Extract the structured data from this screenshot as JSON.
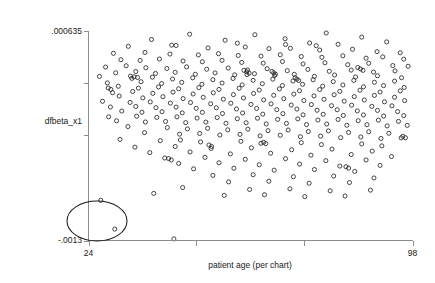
{
  "chart_data": {
    "type": "scatter",
    "title": "",
    "xlabel": "patient age (per chart)",
    "ylabel": "dfbeta_x1",
    "xlim": [
      24,
      98
    ],
    "ylim": [
      -0.0013,
      0.000635
    ],
    "grid": false,
    "legend": null,
    "x_tick_labels": [
      "24",
      "98"
    ],
    "y_tick_labels": [
      ".000635",
      "-.0013"
    ],
    "x_ticks": [
      24,
      48.6,
      73.3,
      98
    ],
    "y_ticks": [
      0.000635,
      0.000154,
      -0.000327,
      -0.0013
    ],
    "marker": "open-circle",
    "annotations": [
      {
        "kind": "ellipse",
        "label": "outlier-highlight-ellipse",
        "cx": 42.5,
        "cy": -0.00122,
        "note": "hand-drawn oval circling two low-leverage outlier points near the origin corner"
      }
    ],
    "points": [
      [
        47.1,
        0.000601
      ],
      [
        62.0,
        0.000596
      ],
      [
        78.3,
        0.000612
      ],
      [
        86.4,
        0.000574
      ],
      [
        92.1,
        0.00053
      ],
      [
        38.4,
        0.000552
      ],
      [
        55.2,
        0.000545
      ],
      [
        68.9,
        0.000559
      ],
      [
        74.5,
        0.00052
      ],
      [
        81.0,
        0.000508
      ],
      [
        33.1,
        0.000489
      ],
      [
        44.0,
        0.000497
      ],
      [
        51.3,
        0.000474
      ],
      [
        59.8,
        0.000483
      ],
      [
        65.2,
        0.000468
      ],
      [
        70.1,
        0.000471
      ],
      [
        76.8,
        0.000455
      ],
      [
        84.3,
        0.000462
      ],
      [
        89.9,
        0.00044
      ],
      [
        95.2,
        0.00043
      ],
      [
        29.7,
        0.000425
      ],
      [
        36.9,
        0.000433
      ],
      [
        42.6,
        0.000418
      ],
      [
        49.1,
        0.00041
      ],
      [
        53.7,
        0.000421
      ],
      [
        58.2,
        0.000405
      ],
      [
        63.4,
        0.000399
      ],
      [
        67.8,
        0.000412
      ],
      [
        72.6,
        0.000395
      ],
      [
        77.3,
        0.000388
      ],
      [
        82.1,
        0.000402
      ],
      [
        87.4,
        0.00038
      ],
      [
        91.2,
        0.000392
      ],
      [
        96.0,
        0.000371
      ],
      [
        31.4,
        0.000366
      ],
      [
        35.8,
        0.000359
      ],
      [
        40.2,
        0.000372
      ],
      [
        45.6,
        0.000354
      ],
      [
        50.0,
        0.000347
      ],
      [
        54.5,
        0.00036
      ],
      [
        59.0,
        0.000341
      ],
      [
        63.9,
        0.000334
      ],
      [
        68.3,
        0.000349
      ],
      [
        73.0,
        0.000327
      ],
      [
        78.0,
        0.000338
      ],
      [
        83.2,
        0.00032
      ],
      [
        88.0,
        0.000333
      ],
      [
        93.5,
        0.000312
      ],
      [
        97.0,
        0.000305
      ],
      [
        27.9,
        0.000298
      ],
      [
        32.6,
        0.00031
      ],
      [
        37.1,
        0.000292
      ],
      [
        41.9,
        0.000285
      ],
      [
        46.4,
        0.0003
      ],
      [
        51.0,
        0.000278
      ],
      [
        55.9,
        0.000289
      ],
      [
        60.3,
        0.000271
      ],
      [
        64.8,
        0.000283
      ],
      [
        69.4,
        0.000265
      ],
      [
        74.1,
        0.000276
      ],
      [
        79.0,
        0.000259
      ],
      [
        84.0,
        0.00027
      ],
      [
        89.1,
        0.000252
      ],
      [
        94.0,
        0.000263
      ],
      [
        30.2,
        0.000245
      ],
      [
        34.8,
        0.000257
      ],
      [
        39.3,
        0.000239
      ],
      [
        43.8,
        0.00025
      ],
      [
        48.4,
        0.000232
      ],
      [
        52.9,
        0.000244
      ],
      [
        57.4,
        0.000226
      ],
      [
        61.9,
        0.000237
      ],
      [
        66.5,
        0.00022
      ],
      [
        71.0,
        0.000231
      ],
      [
        75.6,
        0.000213
      ],
      [
        80.2,
        0.000225
      ],
      [
        85.0,
        0.000207
      ],
      [
        90.0,
        0.000218
      ],
      [
        95.5,
        0.0002
      ],
      [
        26.5,
        0.000212
      ],
      [
        33.9,
        0.000194
      ],
      [
        38.6,
        0.000205
      ],
      [
        43.2,
        0.000188
      ],
      [
        47.8,
        0.000199
      ],
      [
        52.4,
        0.000182
      ],
      [
        57.0,
        0.000193
      ],
      [
        61.6,
        0.000176
      ],
      [
        66.1,
        0.000187
      ],
      [
        70.7,
        0.00017
      ],
      [
        75.3,
        0.000181
      ],
      [
        79.9,
        0.000164
      ],
      [
        84.6,
        0.000175
      ],
      [
        89.3,
        0.000158
      ],
      [
        93.9,
        0.000169
      ],
      [
        28.3,
        0.000152
      ],
      [
        36.0,
        0.000163
      ],
      [
        40.7,
        0.000146
      ],
      [
        45.3,
        0.000157
      ],
      [
        49.9,
        0.00014
      ],
      [
        54.5,
        0.000151
      ],
      [
        59.1,
        0.000134
      ],
      [
        63.7,
        0.000145
      ],
      [
        68.3,
        0.000128
      ],
      [
        72.9,
        0.000139
      ],
      [
        77.5,
        0.000122
      ],
      [
        82.1,
        0.000133
      ],
      [
        86.8,
        0.000116
      ],
      [
        91.4,
        0.000127
      ],
      [
        96.1,
        0.00011
      ],
      [
        30.8,
        0.000121
      ],
      [
        35.4,
        0.000104
      ],
      [
        40.0,
        0.000115
      ],
      [
        44.6,
        9.8e-05
      ],
      [
        49.2,
        0.000109
      ],
      [
        53.8,
        9.2e-05
      ],
      [
        58.4,
        0.000103
      ],
      [
        63.0,
        8.6e-05
      ],
      [
        67.6,
        9.7e-05
      ],
      [
        72.2,
        8e-05
      ],
      [
        76.8,
        9.1e-05
      ],
      [
        81.4,
        7.4e-05
      ],
      [
        86.0,
        8.5e-05
      ],
      [
        90.6,
        6.8e-05
      ],
      [
        95.2,
        7.9e-05
      ],
      [
        29.5,
        6.2e-05
      ],
      [
        34.1,
        7.3e-05
      ],
      [
        38.7,
        5.6e-05
      ],
      [
        43.3,
        6.7e-05
      ],
      [
        47.9,
        5e-05
      ],
      [
        52.5,
        6.1e-05
      ],
      [
        57.1,
        4.4e-05
      ],
      [
        61.7,
        5.5e-05
      ],
      [
        66.3,
        3.8e-05
      ],
      [
        70.9,
        4.9e-05
      ],
      [
        75.5,
        3.2e-05
      ],
      [
        80.1,
        4.3e-05
      ],
      [
        84.7,
        2.6e-05
      ],
      [
        89.3,
        3.7e-05
      ],
      [
        93.9,
        2e-05
      ],
      [
        31.0,
        3.1e-05
      ],
      [
        36.4,
        1.4e-05
      ],
      [
        41.0,
        2.5e-05
      ],
      [
        45.6,
        8e-06
      ],
      [
        50.2,
        1.9e-05
      ],
      [
        54.8,
        2e-06
      ],
      [
        59.4,
        1.3e-05
      ],
      [
        64.0,
        -4e-06
      ],
      [
        68.6,
        7e-06
      ],
      [
        73.2,
        -1e-05
      ],
      [
        77.8,
        1e-06
      ],
      [
        82.4,
        -1.6e-05
      ],
      [
        87.0,
        -5e-06
      ],
      [
        91.6,
        -2.2e-05
      ],
      [
        96.2,
        -1.1e-05
      ],
      [
        27.2,
        -1.7e-05
      ],
      [
        33.5,
        -2.8e-05
      ],
      [
        38.1,
        -2.3e-05
      ],
      [
        42.7,
        -3.4e-05
      ],
      [
        47.3,
        -2.9e-05
      ],
      [
        51.9,
        -4e-05
      ],
      [
        56.5,
        -3.5e-05
      ],
      [
        61.1,
        -4.6e-05
      ],
      [
        65.7,
        -4.1e-05
      ],
      [
        70.3,
        -5.2e-05
      ],
      [
        74.9,
        -4.7e-05
      ],
      [
        79.5,
        -5.8e-05
      ],
      [
        84.1,
        -5.3e-05
      ],
      [
        88.7,
        -6.4e-05
      ],
      [
        93.3,
        -5.9e-05
      ],
      [
        29.0,
        -7e-05
      ],
      [
        34.8,
        -6.5e-05
      ],
      [
        39.4,
        -7.6e-05
      ],
      [
        44.0,
        -7.1e-05
      ],
      [
        48.6,
        -8.2e-05
      ],
      [
        53.2,
        -7.7e-05
      ],
      [
        57.8,
        -8.8e-05
      ],
      [
        62.4,
        -8.3e-05
      ],
      [
        67.0,
        -9.4e-05
      ],
      [
        71.6,
        -8.9e-05
      ],
      [
        76.2,
        -0.0001
      ],
      [
        80.8,
        -9.5e-05
      ],
      [
        85.4,
        -0.000106
      ],
      [
        90.0,
        -0.000101
      ],
      [
        94.6,
        -0.000112
      ],
      [
        31.6,
        -0.000107
      ],
      [
        36.2,
        -0.000118
      ],
      [
        40.8,
        -0.000113
      ],
      [
        45.4,
        -0.000124
      ],
      [
        50.0,
        -0.000119
      ],
      [
        54.6,
        -0.00013
      ],
      [
        59.2,
        -0.000125
      ],
      [
        63.8,
        -0.000136
      ],
      [
        68.4,
        -0.000131
      ],
      [
        73.0,
        -0.000142
      ],
      [
        77.6,
        -0.000137
      ],
      [
        82.2,
        -0.000148
      ],
      [
        86.8,
        -0.000143
      ],
      [
        91.4,
        -0.000154
      ],
      [
        96.0,
        -0.000149
      ],
      [
        28.6,
        -0.00016
      ],
      [
        35.0,
        -0.000155
      ],
      [
        39.6,
        -0.000166
      ],
      [
        44.2,
        -0.000161
      ],
      [
        48.8,
        -0.000172
      ],
      [
        53.4,
        -0.000167
      ],
      [
        58.0,
        -0.000178
      ],
      [
        62.6,
        -0.000173
      ],
      [
        67.2,
        -0.000184
      ],
      [
        71.8,
        -0.000179
      ],
      [
        76.4,
        -0.00019
      ],
      [
        81.0,
        -0.000185
      ],
      [
        85.6,
        -0.000196
      ],
      [
        90.2,
        -0.000191
      ],
      [
        94.8,
        -0.000202
      ],
      [
        30.4,
        -0.000197
      ],
      [
        37.0,
        -0.000208
      ],
      [
        41.6,
        -0.000203
      ],
      [
        46.2,
        -0.000214
      ],
      [
        50.8,
        -0.000209
      ],
      [
        55.4,
        -0.00022
      ],
      [
        60.0,
        -0.000215
      ],
      [
        64.6,
        -0.000226
      ],
      [
        69.2,
        -0.000221
      ],
      [
        73.8,
        -0.000232
      ],
      [
        78.4,
        -0.000227
      ],
      [
        83.0,
        -0.000238
      ],
      [
        87.6,
        -0.000233
      ],
      [
        92.2,
        -0.000244
      ],
      [
        96.8,
        -0.000239
      ],
      [
        33.0,
        -0.00025
      ],
      [
        42.0,
        -0.00026
      ],
      [
        46.6,
        -0.000272
      ],
      [
        51.2,
        -0.000266
      ],
      [
        55.8,
        -0.00028
      ],
      [
        60.4,
        -0.000274
      ],
      [
        65.0,
        -0.000288
      ],
      [
        69.6,
        -0.000282
      ],
      [
        74.2,
        -0.000296
      ],
      [
        78.8,
        -0.00029
      ],
      [
        83.4,
        -0.000304
      ],
      [
        88.0,
        -0.000298
      ],
      [
        92.6,
        -0.000312
      ],
      [
        36.8,
        -0.000306
      ],
      [
        44.8,
        -0.00032
      ],
      [
        49.4,
        -0.000314
      ],
      [
        54.0,
        -0.000328
      ],
      [
        58.6,
        -0.000322
      ],
      [
        63.2,
        -0.000336
      ],
      [
        67.8,
        -0.00033
      ],
      [
        72.4,
        -0.000344
      ],
      [
        77.0,
        -0.000338
      ],
      [
        81.6,
        -0.000352
      ],
      [
        86.2,
        -0.000346
      ],
      [
        90.8,
        -0.00036
      ],
      [
        95.4,
        -0.000354
      ],
      [
        31.2,
        -0.000368
      ],
      [
        40.4,
        -0.00038
      ],
      [
        45.0,
        -0.000374
      ],
      [
        49.6,
        -0.000392
      ],
      [
        58.8,
        -0.000386
      ],
      [
        63.4,
        -0.000404
      ],
      [
        72.6,
        -0.000398
      ],
      [
        77.2,
        -0.000416
      ],
      [
        86.4,
        -0.00041
      ],
      [
        91.0,
        -0.000428
      ],
      [
        34.6,
        -0.00044
      ],
      [
        43.8,
        -0.000434
      ],
      [
        52.0,
        -0.000452
      ],
      [
        61.2,
        -0.000446
      ],
      [
        70.4,
        -0.000464
      ],
      [
        79.6,
        -0.000458
      ],
      [
        88.8,
        -0.000476
      ],
      [
        38.0,
        -0.00049
      ],
      [
        47.2,
        -0.000484
      ],
      [
        56.4,
        -0.000502
      ],
      [
        65.6,
        -0.000496
      ],
      [
        74.8,
        -0.000514
      ],
      [
        84.0,
        -0.000508
      ],
      [
        93.2,
        -0.000526
      ],
      [
        41.4,
        -0.00054
      ],
      [
        50.6,
        -0.000534
      ],
      [
        59.8,
        -0.000552
      ],
      [
        69.0,
        -0.000546
      ],
      [
        78.2,
        -0.000564
      ],
      [
        87.4,
        -0.000558
      ],
      [
        44.6,
        -0.00059
      ],
      [
        53.8,
        -0.000584
      ],
      [
        63.0,
        -0.000602
      ],
      [
        72.2,
        -0.000596
      ],
      [
        81.4,
        -0.000614
      ],
      [
        90.6,
        -0.000608
      ],
      [
        48.0,
        -0.00064
      ],
      [
        57.2,
        -0.000634
      ],
      [
        66.4,
        -0.000652
      ],
      [
        75.6,
        -0.000646
      ],
      [
        84.8,
        -0.000664
      ],
      [
        52.4,
        -0.0007
      ],
      [
        61.6,
        -0.000694
      ],
      [
        70.8,
        -0.000712
      ],
      [
        80.0,
        -0.000706
      ],
      [
        89.2,
        -0.000724
      ],
      [
        56.0,
        -0.00076
      ],
      [
        65.2,
        -0.000754
      ],
      [
        74.4,
        -0.000772
      ],
      [
        83.6,
        -0.000766
      ],
      [
        45.5,
        -0.000812
      ],
      [
        60.8,
        -0.00083
      ],
      [
        70.0,
        -0.000824
      ],
      [
        79.2,
        -0.000842
      ],
      [
        88.4,
        -0.000836
      ],
      [
        38.9,
        -0.000866
      ],
      [
        55.0,
        -0.000884
      ],
      [
        64.2,
        -0.000878
      ],
      [
        73.4,
        -0.000896
      ],
      [
        82.6,
        -0.00089
      ],
      [
        33.6,
        0.000215
      ],
      [
        34.4,
        0.000208
      ],
      [
        35.2,
        0.000202
      ],
      [
        26.8,
        -0.00093
      ],
      [
        43.0,
        0.0005
      ],
      [
        58.0,
        0.000518
      ],
      [
        69.0,
        0.000506
      ],
      [
        76.0,
        0.000495
      ],
      [
        59.5,
        0.000268
      ],
      [
        60.1,
        0.000255
      ],
      [
        60.7,
        0.000242
      ],
      [
        60.2,
        0.000229
      ],
      [
        65.9,
        0.000258
      ],
      [
        66.3,
        0.000245
      ],
      [
        66.7,
        0.000232
      ],
      [
        71.2,
        0.0002
      ],
      [
        71.6,
        0.000187
      ],
      [
        72.0,
        0.000174
      ],
      [
        85.5,
        0.000294
      ],
      [
        86.1,
        0.000281
      ],
      [
        86.7,
        0.000268
      ],
      [
        28.5,
        0.000105
      ],
      [
        29.1,
        9.2e-05
      ],
      [
        51.5,
        -0.00042
      ],
      [
        52.1,
        -0.000433
      ],
      [
        64.0,
        -0.000395
      ],
      [
        64.5,
        -0.000408
      ],
      [
        42.3,
        -0.000545
      ],
      [
        42.9,
        -0.000558
      ],
      [
        95.8,
        -0.00034
      ],
      [
        96.4,
        -0.000353
      ],
      [
        82.8,
        -0.00062
      ],
      [
        83.4,
        -0.000633
      ],
      [
        30.0,
        -0.001195
      ],
      [
        43.5,
        -0.001285
      ]
    ]
  },
  "axis": {
    "y_top_label": ".000635",
    "y_bottom_label": "-.0013",
    "y_axis_title": "dfbeta_x1",
    "x_left_label": "24",
    "x_right_label": "98",
    "x_axis_title": "patient age (per chart)"
  },
  "colors": {
    "background": "#ffffff",
    "axis": "#8c8c8c",
    "marker_stroke": "#262626",
    "annotation": "#1a1a1a",
    "text": "#1a1a1a"
  }
}
